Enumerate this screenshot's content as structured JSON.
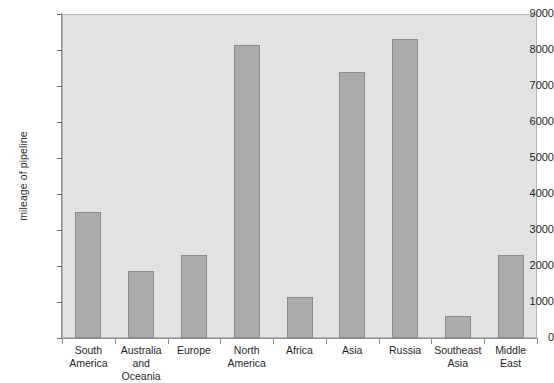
{
  "chart_data": {
    "type": "bar",
    "title": "",
    "subtitle": "",
    "xlabel": "",
    "ylabel": "mileage of pipeline",
    "categories": [
      "South America",
      "Australia and Oceania",
      "Europe",
      "North America",
      "Africa",
      "Asia",
      "Russia",
      "Southeast Asia",
      "Middle East"
    ],
    "category_lines": [
      [
        "South",
        "America"
      ],
      [
        "Australia",
        "and Oceania"
      ],
      [
        "Europe"
      ],
      [
        "North",
        "America"
      ],
      [
        "Africa"
      ],
      [
        "Asia"
      ],
      [
        "Russia"
      ],
      [
        "Southeast",
        "Asia"
      ],
      [
        "Middle",
        "East"
      ]
    ],
    "values": [
      3500,
      1850,
      2300,
      8150,
      1150,
      7400,
      8300,
      600,
      2300
    ],
    "ylim": [
      0,
      9000
    ],
    "ytick_values": [
      0,
      1000,
      2000,
      3000,
      4000,
      5000,
      6000,
      7000,
      8000,
      9000
    ],
    "ytick_labels": [
      "0",
      "1000",
      "2000",
      "3000",
      "4000",
      "5000",
      "6000",
      "7000",
      "8000",
      "9000"
    ],
    "grid": false,
    "legend": null,
    "legend_position": "none",
    "bar_color": "#ababab",
    "bar_border_color": "#8b8b8b",
    "plot_background": "#e2e2e2",
    "axis_color": "#8f8f8f",
    "text_color": "#1f1f1f"
  }
}
